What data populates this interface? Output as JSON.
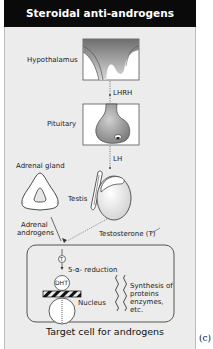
{
  "header": {
    "title": "Steroidal anti-androgens"
  },
  "labels": {
    "hypothalamus": "Hypothalamus",
    "lhrh": "LHRH",
    "pituitary": "Pituitary",
    "lh": "LH",
    "adrenal_gland": "Adrenal gland",
    "testis": "Testis",
    "adrenal_androgens_1": "Adrenal",
    "adrenal_androgens_2": "androgens",
    "testosterone": "Testosterone (T)",
    "t_marker": "T",
    "reduction": "5-α- reduction",
    "dht": "DHT",
    "nucleus": "Nucleus",
    "synthesis_1": "Synthesis of",
    "synthesis_2": "proteins",
    "synthesis_3": "enzymes,",
    "synthesis_4": "etc."
  },
  "caption": "Target cell for androgens",
  "figure_label": "(c)",
  "colors": {
    "header_bg": "#0a0a0a",
    "panel_bg": "#ececec",
    "shade": "#8a8a8a"
  }
}
